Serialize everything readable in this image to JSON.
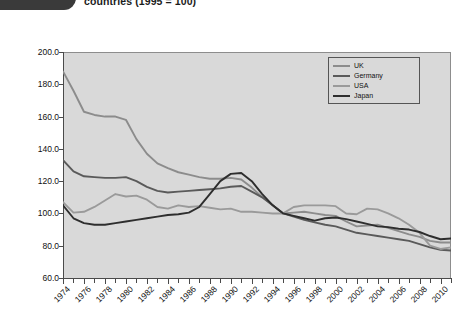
{
  "header": {
    "badge_label": "",
    "title": "countries (1995 = 100)"
  },
  "chart_data": {
    "type": "line",
    "title": "countries (1995 = 100)",
    "xlabel": "",
    "ylabel": "",
    "xlim": [
      1974,
      2011
    ],
    "ylim": [
      60.0,
      200.0
    ],
    "grid": false,
    "legend_position": "top-right",
    "ytick_labels": [
      "200.0",
      "180.0",
      "160.0",
      "140.0",
      "120.0",
      "100.0",
      "80.0",
      "60.0"
    ],
    "ytick_values": [
      200.0,
      180.0,
      160.0,
      140.0,
      120.0,
      100.0,
      80.0,
      60.0
    ],
    "xtick_labels": [
      "1974",
      "1976",
      "1978",
      "1980",
      "1982",
      "1984",
      "1986",
      "1988",
      "1990",
      "1992",
      "1994",
      "1996",
      "1998",
      "2000",
      "2002",
      "2004",
      "2006",
      "2008",
      "2010"
    ],
    "xtick_values": [
      1974,
      1976,
      1978,
      1980,
      1982,
      1984,
      1986,
      1988,
      1990,
      1992,
      1994,
      1996,
      1998,
      2000,
      2002,
      2004,
      2006,
      2008,
      2010
    ],
    "x": [
      1974,
      1975,
      1976,
      1977,
      1978,
      1979,
      1980,
      1981,
      1982,
      1983,
      1984,
      1985,
      1986,
      1987,
      1988,
      1989,
      1990,
      1991,
      1992,
      1993,
      1994,
      1995,
      1996,
      1997,
      1998,
      1999,
      2000,
      2001,
      2002,
      2003,
      2004,
      2005,
      2006,
      2007,
      2008,
      2009,
      2010,
      2011
    ],
    "series": [
      {
        "name": "UK",
        "color": "#8c8c8c",
        "values": [
          188.0,
          176.0,
          163.0,
          161.0,
          160.0,
          160.0,
          158.0,
          146.0,
          137.0,
          131.0,
          128.0,
          125.5,
          124.0,
          122.5,
          121.5,
          121.5,
          122.0,
          121.0,
          116.0,
          110.0,
          105.0,
          100.0,
          100.5,
          101.0,
          100.0,
          99.0,
          98.5,
          95.0,
          92.0,
          92.5,
          93.0,
          91.0,
          89.0,
          87.0,
          85.5,
          83.0,
          82.0,
          82.0
        ]
      },
      {
        "name": "Germany",
        "color": "#5a5a5a",
        "values": [
          133.0,
          126.0,
          123.0,
          122.5,
          122.0,
          122.0,
          122.5,
          120.0,
          116.5,
          114.0,
          113.0,
          113.5,
          114.0,
          114.5,
          115.0,
          115.5,
          116.5,
          117.0,
          113.5,
          110.0,
          105.0,
          100.0,
          98.0,
          96.0,
          94.5,
          93.0,
          92.0,
          90.0,
          88.0,
          87.0,
          86.0,
          85.0,
          84.0,
          83.0,
          81.0,
          79.0,
          77.5,
          77.0
        ]
      },
      {
        "name": "USA",
        "color": "#9a9a9a",
        "values": [
          107.0,
          100.5,
          101.0,
          104.0,
          108.0,
          112.0,
          110.5,
          111.0,
          108.5,
          104.0,
          103.0,
          105.0,
          104.0,
          104.5,
          103.5,
          102.5,
          103.0,
          101.0,
          101.0,
          100.5,
          100.0,
          100.0,
          104.0,
          105.0,
          105.0,
          105.0,
          104.5,
          100.0,
          99.5,
          103.0,
          102.5,
          100.0,
          97.0,
          93.0,
          88.0,
          80.0,
          78.0,
          79.0
        ]
      },
      {
        "name": "Japan",
        "color": "#2e2e2e",
        "values": [
          105.0,
          97.0,
          94.0,
          93.0,
          93.0,
          94.0,
          95.0,
          96.0,
          97.0,
          98.0,
          99.0,
          99.5,
          100.5,
          104.0,
          112.0,
          120.0,
          124.5,
          125.0,
          120.0,
          112.0,
          105.0,
          100.0,
          98.5,
          97.0,
          95.5,
          97.0,
          97.5,
          96.5,
          95.0,
          93.5,
          92.0,
          91.5,
          90.5,
          90.0,
          88.5,
          86.0,
          84.0,
          84.5
        ]
      }
    ]
  },
  "legend": {
    "items": [
      {
        "label": "UK",
        "color": "#8c8c8c"
      },
      {
        "label": "Germany",
        "color": "#5a5a5a"
      },
      {
        "label": "USA",
        "color": "#9a9a9a"
      },
      {
        "label": "Japan",
        "color": "#2e2e2e"
      }
    ]
  }
}
